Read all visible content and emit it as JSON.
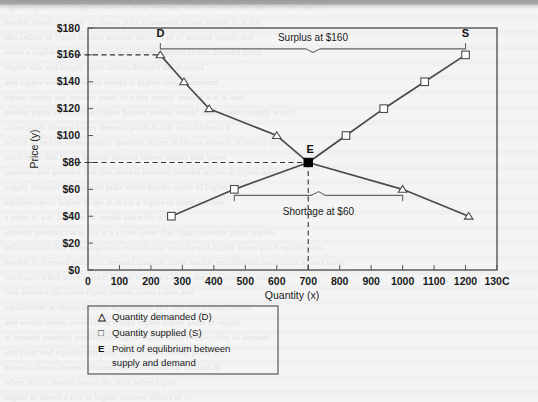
{
  "chart_data": {
    "type": "line",
    "title": "",
    "xlabel": "Quantity (x)",
    "ylabel": "Price (y)",
    "xlim": [
      0,
      1300
    ],
    "ylim": [
      0,
      180
    ],
    "xticks": [
      "0",
      "100",
      "200",
      "300",
      "400",
      "500",
      "600",
      "700",
      "800",
      "900",
      "1000",
      "1100",
      "1200",
      "1300"
    ],
    "yticks": [
      "$0",
      "$20",
      "$40",
      "$60",
      "$80",
      "$100",
      "$120",
      "$140",
      "$160",
      "$180"
    ],
    "grid": false,
    "legend_position": "below-axes",
    "series": [
      {
        "name": "Quantity demanded (D)",
        "marker": "triangle",
        "endpoint_label": "D",
        "points": [
          {
            "x": 230,
            "y": 160
          },
          {
            "x": 305,
            "y": 140
          },
          {
            "x": 385,
            "y": 120
          },
          {
            "x": 600,
            "y": 100
          },
          {
            "x": 700,
            "y": 80
          },
          {
            "x": 1000,
            "y": 60
          },
          {
            "x": 1210,
            "y": 40
          }
        ]
      },
      {
        "name": "Quantity supplied (S)",
        "marker": "square",
        "endpoint_label": "S",
        "points": [
          {
            "x": 265,
            "y": 40
          },
          {
            "x": 465,
            "y": 60
          },
          {
            "x": 700,
            "y": 80
          },
          {
            "x": 820,
            "y": 100
          },
          {
            "x": 940,
            "y": 120
          },
          {
            "x": 1070,
            "y": 140
          },
          {
            "x": 1200,
            "y": 160
          }
        ]
      }
    ],
    "equilibrium": {
      "label": "E",
      "x": 700,
      "y": 80,
      "marker": "filled-square"
    },
    "annotations": [
      {
        "name": "surplus",
        "text": "Surplus at $160",
        "price": 160,
        "from_x": 230,
        "to_x": 1200
      },
      {
        "name": "shortage",
        "text": "Shortage at $60",
        "price": 60,
        "from_x": 465,
        "to_x": 1000
      }
    ],
    "reference_lines": [
      {
        "name": "price-160",
        "value": 160,
        "orientation": "horizontal",
        "style": "dashed"
      },
      {
        "name": "price-80",
        "value": 80,
        "orientation": "horizontal",
        "style": "dashed"
      },
      {
        "name": "quantity-700",
        "value": 700,
        "orientation": "vertical",
        "style": "dashed"
      }
    ]
  },
  "legend": {
    "items": [
      {
        "key": "△",
        "label": "Quantity demanded (D)"
      },
      {
        "key": "□",
        "label": "Quantity supplied (S)"
      },
      {
        "key": "E",
        "label": "Point of equlibrium between",
        "label2": "supply and demand"
      }
    ]
  },
  "colors": {
    "line": "#4a4a4a",
    "text": "#1a1a1a",
    "frame": "#555555",
    "marker_fill": "#ffffff",
    "equilibrium_fill": "#000000",
    "page_bg": "#f4f4f4"
  }
}
